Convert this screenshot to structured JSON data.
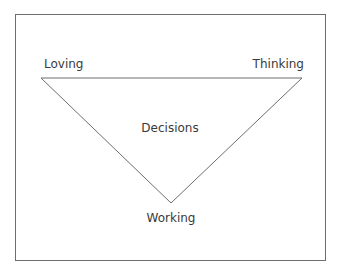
{
  "diagram": {
    "type": "inverted-triangle",
    "colors": {
      "line": "#6e6e6e",
      "text": "#3a3a3a",
      "background": "#ffffff"
    },
    "vertices": {
      "top_left": "Loving",
      "top_right": "Thinking",
      "bottom": "Working"
    },
    "center": "Decisions"
  }
}
